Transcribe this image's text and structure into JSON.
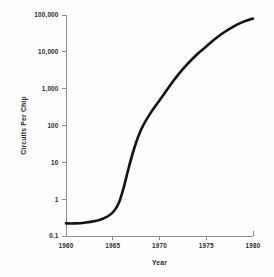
{
  "chart_data": {
    "type": "line",
    "title": "",
    "xlabel": "Year",
    "ylabel": "Circuits Per Chip",
    "yscale": "log",
    "xscale": "linear",
    "xlim": [
      1960,
      1980
    ],
    "ylim": [
      0.1,
      100000
    ],
    "grid": false,
    "legend": null,
    "xticks": [
      1960,
      1965,
      1970,
      1975,
      1980
    ],
    "xticklabels": [
      "1960",
      "1965",
      "1970",
      "1975",
      "1980"
    ],
    "yticks": [
      0.1,
      1,
      10,
      100,
      1000,
      10000,
      100000
    ],
    "yticklabels": [
      "0.1",
      "1",
      "10",
      "100",
      "1,000",
      "10,000",
      "100,000"
    ],
    "series": [
      {
        "name": "Circuits Per Chip",
        "color": "#121212",
        "x": [
          1960.0,
          1961.0,
          1962.0,
          1963.0,
          1964.0,
          1964.6,
          1965.2,
          1965.7,
          1966.2,
          1966.7,
          1967.2,
          1967.7,
          1968.2,
          1969.0,
          1970.0,
          1971.0,
          1972.0,
          1973.0,
          1974.0,
          1975.0,
          1976.0,
          1977.0,
          1978.0,
          1979.0,
          1980.0
        ],
        "y": [
          0.22,
          0.22,
          0.23,
          0.25,
          0.3,
          0.36,
          0.5,
          0.85,
          2.2,
          7.0,
          20.0,
          48.0,
          95.0,
          210.0,
          480.0,
          1100.0,
          2400.0,
          4700.0,
          8500.0,
          14000.0,
          23000.0,
          35000.0,
          50000.0,
          66000.0,
          80000.0
        ]
      }
    ]
  },
  "axes": {
    "x_title": "Year",
    "y_title": "Circuits Per Chip"
  },
  "colors": {
    "curve": "#121212",
    "axis": "#8c8c8c",
    "text": "#2a2a2a",
    "background": "#fefefe"
  }
}
